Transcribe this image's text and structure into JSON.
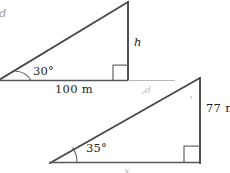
{
  "figure": {
    "background_color": "#ffffff",
    "line_color": "#4a4a4a",
    "text_color": "#1f1f1f",
    "triangle_one": {
      "name": "upper-left-right-triangle",
      "angle_label": "30°",
      "base_label": "100 m",
      "vertical_side_label": "h",
      "hypotenuse_label": "d",
      "right_angle_marker": true
    },
    "triangle_two": {
      "name": "lower-right-right-triangle",
      "angle_label": "35°",
      "vertical_side_label": "77 m",
      "base_label": "x",
      "hypotenuse_label": "d",
      "right_angle_marker": true
    }
  }
}
